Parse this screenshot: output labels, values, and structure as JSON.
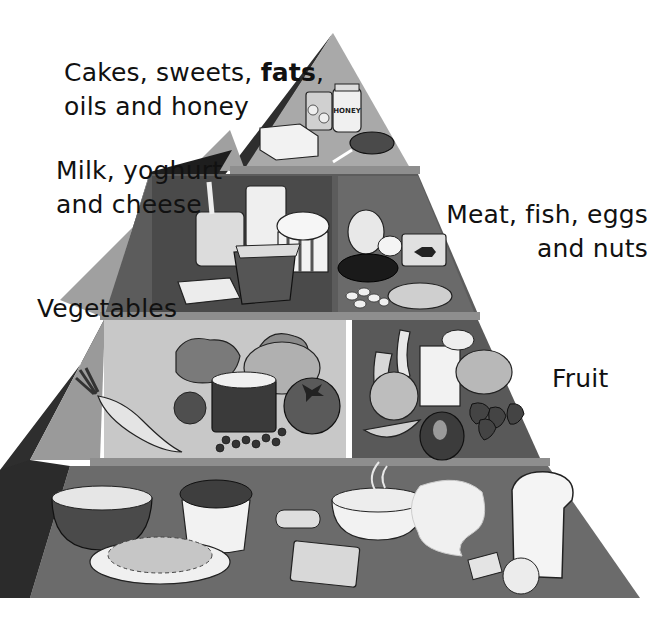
{
  "diagram": {
    "type": "food-pyramid",
    "tiers": [
      {
        "id": "top",
        "label_parts": [
          "Cakes, sweets, ",
          "fats",
          ","
        ],
        "label_line2": "oils and honey",
        "bold_word": "fats",
        "foods": [
          "can of fruit",
          "honey jar",
          "butter",
          "lollipop"
        ]
      },
      {
        "id": "dairy",
        "label_line1": "Milk, yoghurt",
        "label_line2": "and cheese",
        "foods": [
          "yoghurt pot with spoon",
          "glass of milk",
          "ice cream tub",
          "yoghurt carton",
          "cheese slices"
        ]
      },
      {
        "id": "protein",
        "label_line1": "Meat, fish, eggs",
        "label_line2": "and nuts",
        "foods": [
          "boiled eggs",
          "can of fish",
          "sausage",
          "nuts",
          "chicken drumstick"
        ]
      },
      {
        "id": "vegetables",
        "label_line1": "Vegetables",
        "foods": [
          "carrot",
          "lettuce",
          "broccoli",
          "can of peas",
          "potato",
          "tomato"
        ]
      },
      {
        "id": "fruit",
        "label_line1": "Fruit",
        "foods": [
          "banana",
          "peach",
          "juice carton",
          "fruit cup",
          "strawberries",
          "apple",
          "melon slice"
        ]
      },
      {
        "id": "grains",
        "label_line1": "",
        "label_note": "label cut off at bottom edge",
        "foods": [
          "bowl of cereal",
          "cup of rice",
          "plate of noodles",
          "biscuit",
          "cracker",
          "bowl of porridge",
          "pita bread",
          "slice of bread",
          "crackers"
        ]
      }
    ],
    "colors": {
      "background": "#ffffff",
      "top_tier": "#a9a9a9",
      "dairy_panel": "#4a4a4a",
      "protein_panel": "#6a6a6a",
      "veg_panel": "#c8c8c8",
      "fruit_panel": "#595959",
      "grain_tier": "#6b6b6b",
      "side_face": "#2e2e2e",
      "side_face_light": "#9a9a9a",
      "ledge": "#8e8e8e",
      "text": "#111111"
    },
    "food_labels": {
      "honey": "HONEY"
    }
  }
}
